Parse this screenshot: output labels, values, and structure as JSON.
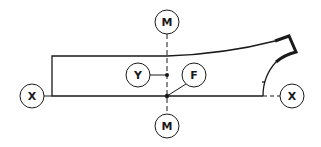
{
  "diagram": {
    "colors": {
      "line": "#1a1a1a",
      "background": "#ffffff"
    },
    "labels": {
      "x_left": "X",
      "x_right": "X",
      "m_top": "M",
      "m_bottom": "M",
      "y": "Y",
      "f": "F"
    },
    "axes": [
      {
        "name": "X-X",
        "orientation": "horizontal",
        "style": "dashed"
      },
      {
        "name": "M-M",
        "orientation": "vertical",
        "style": "dashed"
      }
    ],
    "points": [
      {
        "label": "Y",
        "type": "dot",
        "on": "M-M axis"
      },
      {
        "label": "F",
        "type": "dot",
        "on": "intersection of X-X and M-M"
      }
    ]
  }
}
